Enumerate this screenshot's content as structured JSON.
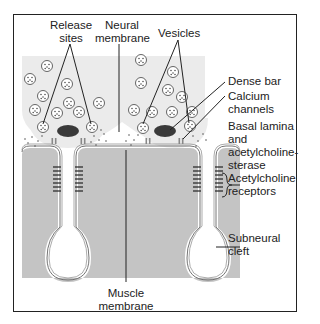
{
  "diagram": {
    "labels": {
      "release_sites": [
        "Release",
        "sites"
      ],
      "neural_membrane": [
        "Neural",
        "membrane"
      ],
      "vesicles": "Vesicles",
      "dense_bar": "Dense bar",
      "calcium_channels": [
        "Calcium",
        "channels"
      ],
      "basal_lamina": [
        "Basal lamina",
        "and",
        "acetylcholine-",
        "sterase"
      ],
      "ach_receptors": [
        "Acetylcholine",
        "receptors"
      ],
      "subneural_cleft": [
        "Subneural",
        "cleft"
      ],
      "muscle_membrane": [
        "Muscle",
        "membrane"
      ]
    },
    "colors": {
      "nerve_terminal": "#ebebeb",
      "muscle": "#c4c4c4",
      "dense_bar": "#3a3a3a",
      "line": "#222222",
      "frame": "#222222"
    }
  }
}
